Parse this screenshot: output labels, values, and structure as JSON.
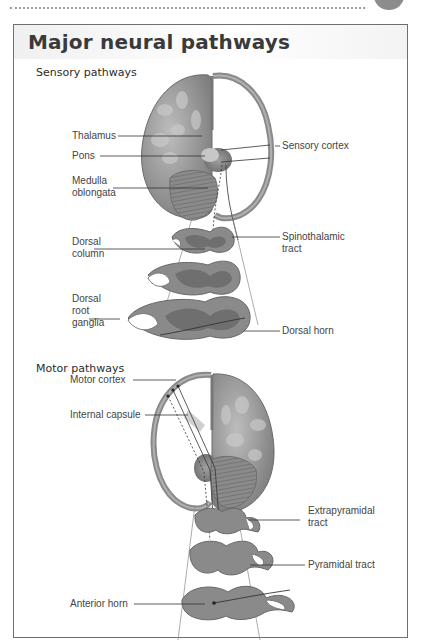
{
  "figure": {
    "title": "Major neural pathways",
    "sections": [
      {
        "title": "Sensory pathways",
        "labels": {
          "thalamus": "Thalamus",
          "pons": "Pons",
          "medulla": "Medulla\noblongata",
          "sensory_cortex": "Sensory cortex",
          "dorsal_column": "Dorsal\ncolumn",
          "spinothalamic": "Spinothalamic\ntract",
          "dorsal_root_ganglia": "Dorsal\nroot\nganglia",
          "dorsal_horn": "Dorsal horn"
        }
      },
      {
        "title": "Motor pathways",
        "labels": {
          "motor_cortex": "Motor cortex",
          "internal_capsule": "Internal capsule",
          "extrapyramidal": "Extrapyramidal\ntract",
          "pyramidal": "Pyramidal tract",
          "anterior_horn": "Anterior horn"
        }
      }
    ]
  },
  "colors": {
    "tissue": "#8a8a8a",
    "tissue_light": "#b5b5b5",
    "tissue_dark": "#6d6d6d",
    "line": "#333333",
    "border": "#6f6f6f"
  }
}
